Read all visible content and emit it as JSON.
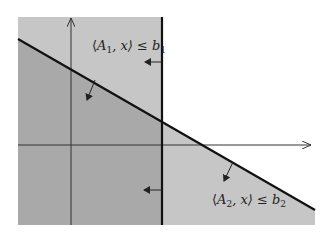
{
  "diagram": {
    "constraints": [
      {
        "id": "c1",
        "label": {
          "open": "⟨",
          "A": "A",
          "sub": "1",
          "mid": ", x⟩ ≤ ",
          "b": "b",
          "bsub": "1"
        }
      },
      {
        "id": "c2",
        "label": {
          "open": "⟨",
          "A": "A",
          "sub": "2",
          "mid": ", x⟩ ≤ ",
          "b": "b",
          "bsub": "2"
        }
      }
    ],
    "colors": {
      "half_space": "#c6c6c6",
      "feasible_region": "#a9a9a9",
      "boundary": "#111111",
      "axis": "#333333",
      "background": "#ffffff"
    }
  }
}
